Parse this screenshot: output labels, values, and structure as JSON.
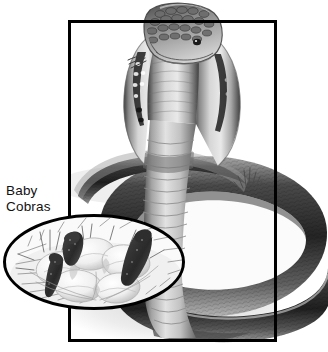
{
  "illustration": {
    "subject": "King Cobra",
    "view": "rearing cobra with spread hood",
    "palette": {
      "frame_stroke": "#000000",
      "background": "#ffffff",
      "body_dark": "#2b2b2b",
      "body_mid": "#7d7d7d",
      "body_light": "#d8d8d8",
      "hood_pattern_dark": "#303030",
      "ground_shadow": "#bcbcbc",
      "ink": "#111111"
    },
    "frame": {
      "x": 68,
      "y": 20,
      "width": 209,
      "height": 322,
      "stroke_width": 3
    }
  },
  "label": {
    "line1": "Baby",
    "line2": "Cobras"
  },
  "inset": {
    "shape": "ellipse",
    "cx": 94,
    "cy": 262,
    "rx": 91,
    "ry": 48,
    "stroke_width": 3,
    "content": "baby cobras hatching from eggs in a nest",
    "hatchling_count": 3,
    "egg_count": 5
  },
  "scene": {
    "elements": [
      "coiled snake body extending beyond right frame edge",
      "grass tufts at ground line",
      "cast shadow on ground",
      "raised neck and spread hood",
      "scaled head with eye"
    ]
  }
}
